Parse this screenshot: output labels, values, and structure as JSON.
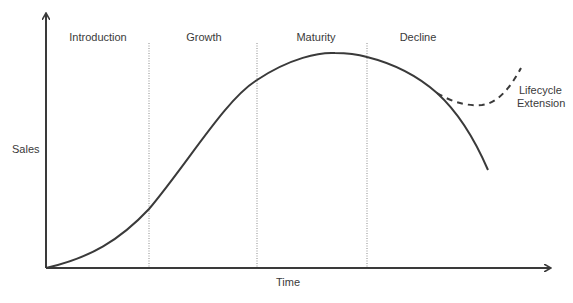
{
  "diagram": {
    "axes": {
      "y_label": "Sales",
      "x_label": "Time"
    },
    "stages": [
      {
        "label": "Introduction"
      },
      {
        "label": "Growth"
      },
      {
        "label": "Maturity"
      },
      {
        "label": "Decline"
      }
    ],
    "extension": {
      "line1": "Lifecycle",
      "line2": "Extension"
    },
    "colors": {
      "curve": "#3a3a3a",
      "axis": "#3a3a3a",
      "divider": "#8a8a8a",
      "text": "#3a3a3a",
      "background": "#ffffff"
    }
  }
}
